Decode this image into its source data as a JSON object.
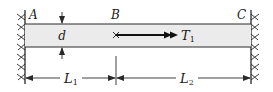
{
  "figure": {
    "type": "torsion-bar-fixed-both-ends",
    "colors": {
      "line": "#2a2a2a",
      "bar_fill": "#ebebeb",
      "background": "#ffffff"
    },
    "supports": {
      "left": {
        "label": "A"
      },
      "right": {
        "label": "C"
      }
    },
    "point_b": {
      "label": "B"
    },
    "diameter": {
      "label": "d"
    },
    "torque": {
      "label": "T",
      "subscript": "1"
    },
    "dimensions": [
      {
        "label": "L",
        "subscript": "1"
      },
      {
        "label": "L",
        "subscript": "2"
      }
    ]
  }
}
